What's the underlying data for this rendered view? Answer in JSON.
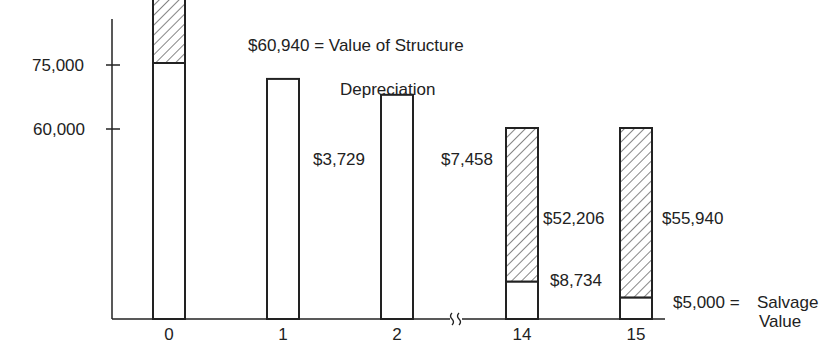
{
  "chart_data": {
    "type": "bar",
    "stacked": true,
    "title": "",
    "xlabel": "",
    "ylabel": "",
    "categories": [
      "0",
      "1",
      "2",
      "14",
      "15"
    ],
    "axis_break_between": [
      "2",
      "14"
    ],
    "y_ticks": [
      {
        "label": "75,000",
        "value": 75000
      },
      {
        "label": "60,000",
        "value": 60000
      }
    ],
    "series": [
      {
        "name": "Remaining value (book value of structure)",
        "style": "open",
        "values": [
          60000,
          56271,
          52542,
          8734,
          5000
        ]
      },
      {
        "name": "Depreciation",
        "style": "hatched",
        "values": [
          15000,
          3729,
          7458,
          52206,
          55940
        ]
      }
    ],
    "annotations": {
      "value_of_structure": "$60,940 = Value of Structure",
      "depreciation": "Depreciation",
      "bar2_depr": "$3,729",
      "bar14_depr_left": "$7,458",
      "bar14_depr_right": "$52,206",
      "bar14_remaining": "$8,734",
      "bar15_depr": "$55,940",
      "salvage_amount": "$5,000 =",
      "salvage_label_line1": "Salvage",
      "salvage_label_line2": "Value"
    },
    "grid": false,
    "legend": "none"
  }
}
